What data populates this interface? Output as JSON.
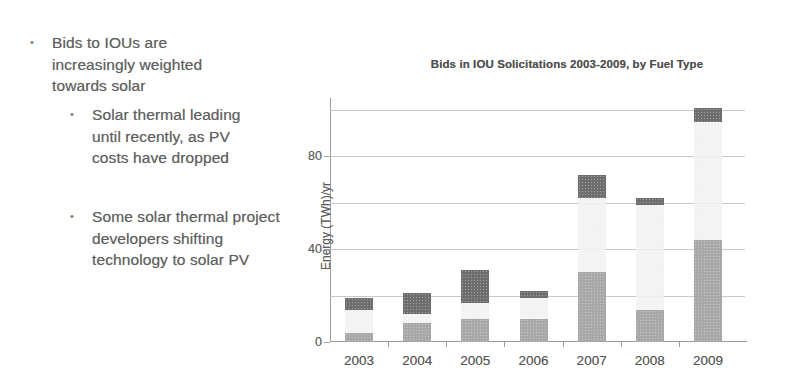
{
  "slide": {
    "bullets": [
      {
        "marker": "•",
        "level": 1,
        "text": "Bids to IOUs are increasingly weighted towards solar"
      },
      {
        "marker": "•",
        "level": 2,
        "text": "Solar thermal leading until recently, as PV costs have dropped"
      },
      {
        "marker": "•",
        "level": 2,
        "text": "Some solar thermal project developers shifting technology to solar PV"
      }
    ]
  },
  "chart_data": {
    "type": "bar",
    "stacked": true,
    "title": "Bids in IOU Solicitations 2003-2009, by Fuel Type",
    "xlabel": "",
    "ylabel": "Energy (TWh)/yr",
    "categories": [
      "2003",
      "2004",
      "2005",
      "2006",
      "2007",
      "2008",
      "2009"
    ],
    "ylim": [
      0,
      100
    ],
    "yticks": [
      0,
      40,
      80
    ],
    "ytick_labels": [
      "0",
      "40",
      "80"
    ],
    "gridlines": [
      20,
      40,
      60,
      80,
      100
    ],
    "grid": true,
    "legend": "none",
    "series": [
      {
        "name": "Solar PV",
        "color": "#a8a8a8",
        "values": [
          4,
          8,
          10,
          10,
          30,
          14,
          44
        ]
      },
      {
        "name": "Wind",
        "color": "#f2f2f2",
        "values": [
          10,
          4,
          7,
          9,
          32,
          45,
          51
        ]
      },
      {
        "name": "Solar Thermal",
        "color": "#6e6e6e",
        "values": [
          5,
          9,
          14,
          3,
          10,
          3,
          6
        ]
      }
    ],
    "totals": [
      19,
      21,
      31,
      22,
      72,
      62,
      101
    ]
  }
}
